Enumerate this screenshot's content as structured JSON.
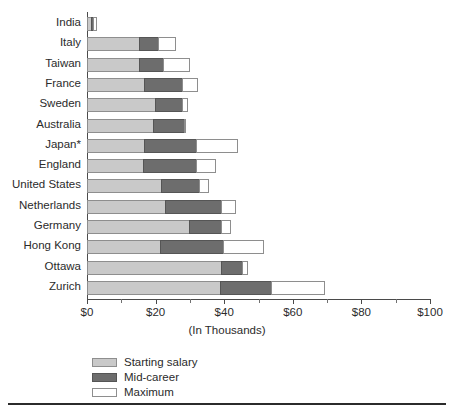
{
  "chart_data": {
    "type": "bar",
    "orientation": "horizontal",
    "stacked": true,
    "title": "",
    "xlabel": "(In Thousands)",
    "ylabel": "",
    "xlim": [
      0,
      100
    ],
    "xticks": [
      "$0",
      "$20",
      "$40",
      "$60",
      "$80",
      "$100"
    ],
    "xtick_values": [
      0,
      20,
      40,
      60,
      80,
      100
    ],
    "minor_tick_values": [
      10,
      30,
      50,
      70,
      90
    ],
    "grid": false,
    "legend_position": "bottom-left",
    "categories": [
      "India",
      "Italy",
      "Taiwan",
      "France",
      "Sweden",
      "Australia",
      "Japan*",
      "England",
      "United States",
      "Netherlands",
      "Germany",
      "Hong Kong",
      "Ottawa",
      "Zurich"
    ],
    "series": [
      {
        "name": "Starting salary",
        "color": "#c9c9c9",
        "values": [
          1.5,
          15.5,
          15.5,
          17,
          20,
          19.5,
          17,
          16.5,
          22,
          23,
          30,
          21.5,
          39.5,
          39
        ]
      },
      {
        "name": "Mid-career",
        "color": "#6d6d6d",
        "values": [
          2,
          21,
          22.5,
          28,
          28,
          28.5,
          32,
          32,
          33,
          39.5,
          39.5,
          40,
          45.5,
          54
        ]
      },
      {
        "name": "Maximum",
        "color": "#ffffff",
        "values": [
          3,
          26,
          30,
          32.5,
          29.5,
          29,
          44,
          37.5,
          35.5,
          43.5,
          42,
          51.5,
          47,
          69.5
        ]
      }
    ],
    "series_note": "Cumulative stacked values: each series value is the right edge of its segment in thousands of dollars."
  },
  "legend": {
    "items": [
      {
        "label": "Starting salary",
        "swatch": "#c9c9c9"
      },
      {
        "label": "Mid-career",
        "swatch": "#6d6d6d"
      },
      {
        "label": "Maximum",
        "swatch": "#ffffff"
      }
    ]
  },
  "colors": {
    "starting": "#c9c9c9",
    "midcareer": "#6d6d6d",
    "maximum": "#ffffff",
    "axis": "#4a4a4a",
    "outline": "#8e8e8e",
    "text": "#2b2b2b"
  }
}
